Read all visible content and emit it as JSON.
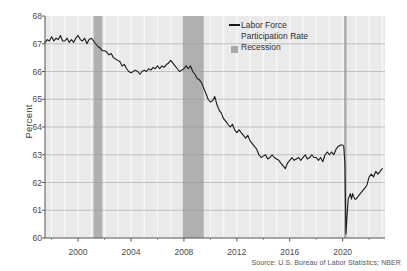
{
  "figure": {
    "y_axis_title": "Percent",
    "source_note": "Source: U.S. Bureau of Labor Statistics; NBER"
  },
  "legend": {
    "series_label": "Labor Force\nParticipation Rate",
    "recession_label": "Recession",
    "line_color": "#1a1a1a",
    "recession_color": "#a8a8a8"
  },
  "colors": {
    "plot_background": "#eaeaea",
    "gridline": "#9a9a9a",
    "minor_gridline": "#f7f7f7",
    "axis": "#555555",
    "line": "#1a1a1a",
    "recession_band": "#b0b0b0",
    "text": "#4a4a4a",
    "page_background": "#ffffff"
  },
  "chart_data": {
    "type": "line",
    "title": "",
    "xlabel": "",
    "ylabel": "Percent",
    "xlim": [
      1997.5,
      2023.2
    ],
    "ylim": [
      60,
      68
    ],
    "ytick_labels": [
      "60",
      "61",
      "62",
      "63",
      "64",
      "65",
      "66",
      "67",
      "68"
    ],
    "yticks": [
      60,
      61,
      62,
      63,
      64,
      65,
      66,
      67,
      68
    ],
    "xtick_labels": [
      "2000",
      "2004",
      "2008",
      "2012",
      "2016",
      "2020"
    ],
    "xticks": [
      2000,
      2004,
      2008,
      2012,
      2016,
      2020
    ],
    "grid": true,
    "legend_position": "top-right",
    "series": [
      {
        "name": "Labor Force Participation Rate",
        "color": "#1a1a1a",
        "x": [
          1997.5,
          1997.67,
          1997.83,
          1998.0,
          1998.17,
          1998.33,
          1998.5,
          1998.67,
          1998.83,
          1999.0,
          1999.17,
          1999.33,
          1999.5,
          1999.67,
          1999.83,
          2000.0,
          2000.17,
          2000.33,
          2000.5,
          2000.67,
          2000.83,
          2001.0,
          2001.17,
          2001.33,
          2001.5,
          2001.67,
          2001.83,
          2002.0,
          2002.17,
          2002.33,
          2002.5,
          2002.67,
          2002.83,
          2003.0,
          2003.17,
          2003.33,
          2003.5,
          2003.67,
          2003.83,
          2004.0,
          2004.17,
          2004.33,
          2004.5,
          2004.67,
          2004.83,
          2005.0,
          2005.17,
          2005.33,
          2005.5,
          2005.67,
          2005.83,
          2006.0,
          2006.17,
          2006.33,
          2006.5,
          2006.67,
          2006.83,
          2007.0,
          2007.17,
          2007.33,
          2007.5,
          2007.67,
          2007.83,
          2008.0,
          2008.17,
          2008.33,
          2008.5,
          2008.67,
          2008.83,
          2009.0,
          2009.17,
          2009.33,
          2009.5,
          2009.67,
          2009.83,
          2010.0,
          2010.17,
          2010.33,
          2010.5,
          2010.67,
          2010.83,
          2011.0,
          2011.17,
          2011.33,
          2011.5,
          2011.67,
          2011.83,
          2012.0,
          2012.17,
          2012.33,
          2012.5,
          2012.67,
          2012.83,
          2013.0,
          2013.17,
          2013.33,
          2013.5,
          2013.67,
          2013.83,
          2014.0,
          2014.17,
          2014.33,
          2014.5,
          2014.67,
          2014.83,
          2015.0,
          2015.17,
          2015.33,
          2015.5,
          2015.67,
          2015.83,
          2016.0,
          2016.17,
          2016.33,
          2016.5,
          2016.67,
          2016.83,
          2017.0,
          2017.17,
          2017.33,
          2017.5,
          2017.67,
          2017.83,
          2018.0,
          2018.17,
          2018.33,
          2018.5,
          2018.67,
          2018.83,
          2019.0,
          2019.17,
          2019.33,
          2019.5,
          2019.67,
          2019.83,
          2020.0,
          2020.08,
          2020.17,
          2020.25,
          2020.33,
          2020.42,
          2020.5,
          2020.58,
          2020.67,
          2020.75,
          2020.83,
          2020.92,
          2021.0,
          2021.17,
          2021.33,
          2021.5,
          2021.67,
          2021.83,
          2022.0,
          2022.17,
          2022.33,
          2022.5,
          2022.67,
          2022.83,
          2023.0
        ],
        "y": [
          67.05,
          67.15,
          67.1,
          67.25,
          67.1,
          67.2,
          67.15,
          67.3,
          67.1,
          67.1,
          67.2,
          67.05,
          67.15,
          67.05,
          67.2,
          67.3,
          67.15,
          67.1,
          67.2,
          67.0,
          67.15,
          67.2,
          67.1,
          67.0,
          66.9,
          66.85,
          66.75,
          66.75,
          66.7,
          66.6,
          66.65,
          66.5,
          66.45,
          66.4,
          66.35,
          66.2,
          66.25,
          66.1,
          66.0,
          65.95,
          66.0,
          66.05,
          66.0,
          65.9,
          66.0,
          66.05,
          66.0,
          66.1,
          66.05,
          66.15,
          66.1,
          66.2,
          66.1,
          66.2,
          66.15,
          66.25,
          66.3,
          66.4,
          66.3,
          66.2,
          66.1,
          66.0,
          66.05,
          66.1,
          66.2,
          66.1,
          66.2,
          66.0,
          65.9,
          65.75,
          65.7,
          65.6,
          65.4,
          65.2,
          65.0,
          64.9,
          64.95,
          65.1,
          64.8,
          64.6,
          64.5,
          64.3,
          64.2,
          64.1,
          64.0,
          64.1,
          63.9,
          63.8,
          63.9,
          63.8,
          63.7,
          63.6,
          63.7,
          63.5,
          63.4,
          63.3,
          63.2,
          63.0,
          62.9,
          62.95,
          63.0,
          62.85,
          62.9,
          63.0,
          62.9,
          62.85,
          62.8,
          62.7,
          62.6,
          62.5,
          62.7,
          62.8,
          62.9,
          62.8,
          62.85,
          62.9,
          62.8,
          62.9,
          63.0,
          62.85,
          62.9,
          63.0,
          62.9,
          62.9,
          62.8,
          62.9,
          62.75,
          63.0,
          63.1,
          63.0,
          63.1,
          63.0,
          63.2,
          63.3,
          63.35,
          63.35,
          63.3,
          62.7,
          60.15,
          60.8,
          61.4,
          61.5,
          61.6,
          61.4,
          61.6,
          61.5,
          61.4,
          61.4,
          61.5,
          61.6,
          61.7,
          61.8,
          61.9,
          62.2,
          62.3,
          62.2,
          62.4,
          62.3,
          62.4,
          62.5
        ]
      }
    ],
    "recession_bands": [
      {
        "label": "2001 recession",
        "start": 2001.17,
        "end": 2001.83
      },
      {
        "label": "2008-09 recession",
        "start": 2007.92,
        "end": 2009.5
      },
      {
        "label": "2020 recession",
        "start": 2020.1,
        "end": 2020.3
      }
    ]
  }
}
